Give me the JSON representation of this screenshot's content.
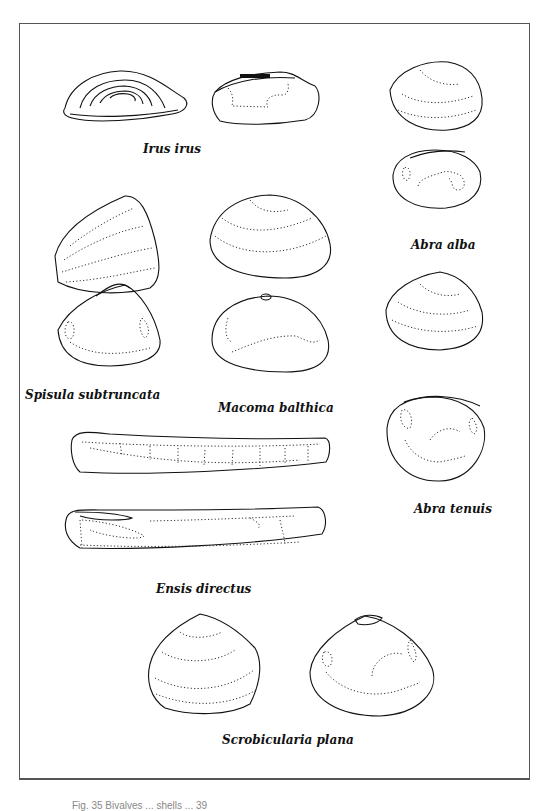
{
  "figure": {
    "type": "species identification plate",
    "caption_partial": "Fig. 35 Bivalves ... shells ... 39"
  },
  "species": [
    {
      "id": "irus",
      "label": "Irus irus",
      "views": [
        "external",
        "internal"
      ]
    },
    {
      "id": "abra-alba",
      "label": "Abra alba",
      "views": [
        "external",
        "internal"
      ]
    },
    {
      "id": "spisula",
      "label": "Spisula subtruncata",
      "views": [
        "external",
        "internal"
      ]
    },
    {
      "id": "macoma",
      "label": "Macoma balthica",
      "views": [
        "external",
        "internal"
      ]
    },
    {
      "id": "abra-tenuis",
      "label": "Abra tenuis",
      "views": [
        "external",
        "internal"
      ]
    },
    {
      "id": "ensis",
      "label": "Ensis directus",
      "views": [
        "external",
        "internal"
      ]
    },
    {
      "id": "scrobicularia",
      "label": "Scrobicularia plana",
      "views": [
        "external",
        "internal"
      ]
    }
  ]
}
